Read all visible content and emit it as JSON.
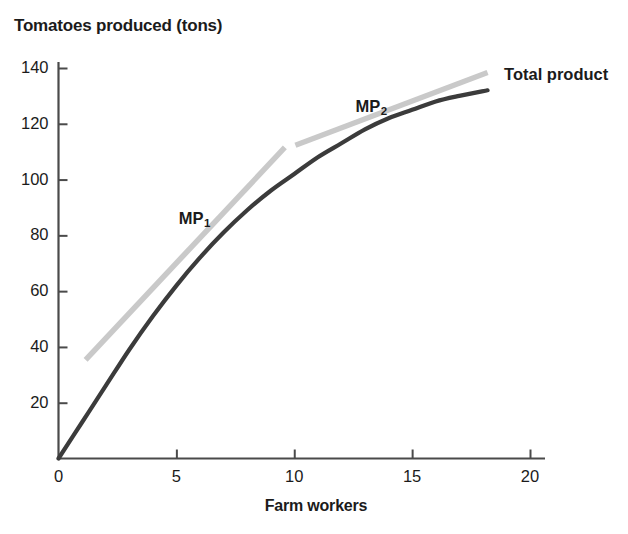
{
  "chart_data": {
    "type": "line",
    "title": "",
    "ylabel": "Tomatoes produced (tons)",
    "xlabel": "Farm workers",
    "xlim": [
      0,
      21.5
    ],
    "ylim": [
      0,
      147
    ],
    "grid": false,
    "legend_position": "inline-right",
    "y_ticks": [
      20,
      40,
      60,
      80,
      100,
      120,
      140
    ],
    "x_ticks": [
      0,
      5,
      10,
      15,
      20
    ],
    "y_tick_labels": [
      "20",
      "40",
      "60",
      "80",
      "100",
      "120",
      "140"
    ],
    "x_tick_labels": [
      "0",
      "5",
      "10",
      "15",
      "20"
    ],
    "series": [
      {
        "name": "Total product",
        "color": "#3b3b3b",
        "x": [
          0,
          1,
          2,
          3,
          4,
          5,
          6,
          7,
          8,
          9,
          10,
          11,
          12,
          13,
          14,
          15,
          16,
          17,
          18.2
        ],
        "values": [
          0,
          13,
          26,
          39,
          51,
          62,
          72,
          81,
          89,
          96,
          102,
          108,
          113,
          118,
          122,
          125,
          128,
          130,
          132
        ]
      },
      {
        "name": "MP1",
        "label": "MP",
        "subscript": "1",
        "color": "#c9c9c9",
        "x": [
          1.15,
          9.6
        ],
        "values": [
          35.4,
          111.5
        ]
      },
      {
        "name": "MP2",
        "label": "MP",
        "subscript": "2",
        "color": "#c9c9c9",
        "x": [
          10.05,
          18.2
        ],
        "values": [
          112.3,
          138.4
        ]
      }
    ],
    "annotations": [
      {
        "text": "MP",
        "subscript": "1",
        "x": 5.1,
        "y": 85.5
      },
      {
        "text": "MP",
        "subscript": "2",
        "x": 12.6,
        "y": 125.5
      },
      {
        "text": "Total product",
        "x": 18.9,
        "y": 137.0
      }
    ],
    "colors": {
      "total_product_line": "#3b3b3b",
      "marginal_product_line": "#c9c9c9",
      "axis": "#4a4a4a",
      "text": "#1b1b1b",
      "background": "#ffffff"
    }
  },
  "axis_title_y": "Tomatoes produced (tons)",
  "axis_title_x": "Farm workers",
  "legend": {
    "total_product": "Total product"
  },
  "labels": {
    "mp1_base": "MP",
    "mp1_sub": "1",
    "mp2_base": "MP",
    "mp2_sub": "2"
  }
}
